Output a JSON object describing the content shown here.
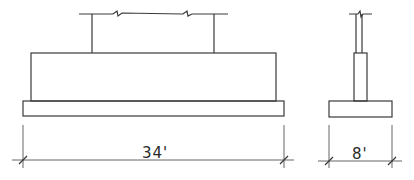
{
  "drawing": {
    "elevation": {
      "width_label": "34'"
    },
    "section": {
      "width_label": "8'"
    },
    "colors": {
      "line": "#3a3a3a",
      "background": "#ffffff"
    }
  }
}
